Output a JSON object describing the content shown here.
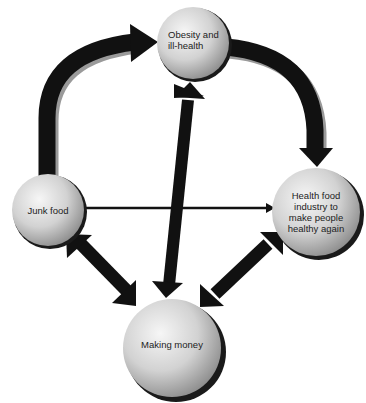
{
  "diagram": {
    "nodes": [
      {
        "id": "obesity",
        "label": "Obesity and\nill-health"
      },
      {
        "id": "junk_food",
        "label": "Junk food"
      },
      {
        "id": "health_food",
        "label": "Health food\nindustry to\nmake people\nhealthy again"
      },
      {
        "id": "making_money",
        "label": "Making money"
      }
    ],
    "edges": [
      {
        "from": "junk_food",
        "to": "obesity",
        "style": "thick-curved",
        "direction": "one-way"
      },
      {
        "from": "obesity",
        "to": "health_food",
        "style": "thick-curved",
        "direction": "one-way"
      },
      {
        "from": "junk_food",
        "to": "health_food",
        "style": "thin",
        "direction": "one-way"
      },
      {
        "from": "making_money",
        "to": "obesity",
        "style": "thick",
        "direction": "two-way"
      },
      {
        "from": "making_money",
        "to": "junk_food",
        "style": "thick",
        "direction": "two-way"
      },
      {
        "from": "making_money",
        "to": "health_food",
        "style": "thick",
        "direction": "two-way"
      }
    ],
    "colors": {
      "arrow": "#111111",
      "arrow_shadow": "#9a9a9a",
      "node_light": "#f4f4f4",
      "node_dark": "#8a8a8a",
      "node_rim": "#1a1a1a"
    }
  }
}
